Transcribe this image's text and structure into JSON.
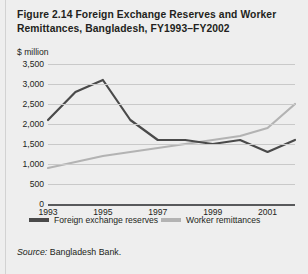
{
  "figure": {
    "title": "Figure 2.14  Foreign Exchange Reserves and Worker Remittances, Bangladesh, FY1993–FY2002",
    "units_label": "$ million",
    "source_keyword": "Source:",
    "source_text": " Bangladesh Bank."
  },
  "colors": {
    "background": "#eeeeee",
    "gridline": "#c9c9c9",
    "axis": "#58595b",
    "reserves_line": "#4a4a4a",
    "remittances_line": "#b3b3b3",
    "text": "#231f20"
  },
  "chart_data": {
    "type": "line",
    "title": "Figure 2.14  Foreign Exchange Reserves and Worker Remittances, Bangladesh, FY1993–FY2002",
    "xlabel": "",
    "ylabel": "$ million",
    "ylim": [
      0,
      3500
    ],
    "ytick_values": [
      0,
      500,
      1000,
      1500,
      2000,
      2500,
      3000,
      3500
    ],
    "ytick_labels": [
      "0",
      "500",
      "1,000",
      "1,500",
      "2,000",
      "2,500",
      "3,000",
      "3,500"
    ],
    "x": [
      1993,
      1994,
      1995,
      1996,
      1997,
      1998,
      1999,
      2000,
      2001,
      2002
    ],
    "xtick_values": [
      1993,
      1995,
      1997,
      1999,
      2001
    ],
    "xtick_labels": [
      "1993",
      "1995",
      "1997",
      "1999",
      "2001"
    ],
    "grid": true,
    "legend_position": "bottom",
    "series": [
      {
        "name": "Foreign exchange reserves",
        "color": "#4a4a4a",
        "values": [
          2100,
          2800,
          3100,
          2100,
          1600,
          1600,
          1500,
          1600,
          1300,
          1600
        ]
      },
      {
        "name": "Worker remittances",
        "color": "#b3b3b3",
        "values": [
          900,
          1050,
          1200,
          1300,
          1400,
          1500,
          1600,
          1700,
          1900,
          2500
        ]
      }
    ]
  }
}
